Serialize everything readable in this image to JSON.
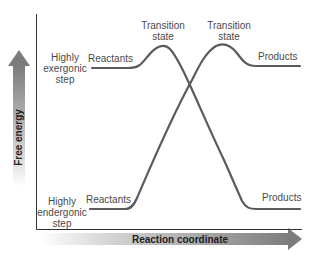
{
  "diagram": {
    "title": "",
    "y_axis_label": "Free energy",
    "x_axis_label": "Reaction coordinate",
    "curves": [
      {
        "name": "Highly exergonic step",
        "label_lines": [
          "Highly",
          "exergonic",
          "step"
        ],
        "reactants_label": "Reactants",
        "transition_label_lines": [
          "Transition",
          "state"
        ],
        "products_label": "Products",
        "color": "#5a5a5a"
      },
      {
        "name": "Highly endergonic step",
        "label_lines": [
          "Highly",
          "endergonic",
          "step"
        ],
        "reactants_label": "Reactants",
        "transition_label_lines": [
          "Transition",
          "state"
        ],
        "products_label": "Products",
        "color": "#5a5a5a"
      }
    ],
    "colors": {
      "curve": "#5a5a5a",
      "axis": "#333333",
      "arrow_dark": "#7a7a7a",
      "arrow_light": "#e6e6e6",
      "background": "#ffffff"
    }
  }
}
